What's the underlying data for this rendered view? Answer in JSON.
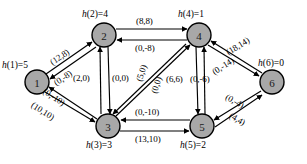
{
  "diagram": {
    "node_fill": "#a8a8a8",
    "stroke": "#000000",
    "nodes": [
      {
        "id": "1",
        "label": "1",
        "h_name": "h",
        "h_arg": "(1)",
        "h_eq": "=",
        "h_value": "5",
        "h_text": "h(1)=5",
        "cx": 37,
        "cy": 82
      },
      {
        "id": "2",
        "label": "2",
        "h_name": "h",
        "h_arg": "(2)",
        "h_eq": "=",
        "h_value": "4",
        "h_text": "h(2)=4",
        "cx": 104,
        "cy": 35
      },
      {
        "id": "3",
        "label": "3",
        "h_name": "h",
        "h_arg": "(3)",
        "h_eq": "=",
        "h_value": "3",
        "h_text": "h(3)=3",
        "cx": 108,
        "cy": 126
      },
      {
        "id": "4",
        "label": "4",
        "h_name": "h",
        "h_arg": "(4)",
        "h_eq": "=",
        "h_value": "1",
        "h_text": "h(4)=1",
        "cx": 199,
        "cy": 35
      },
      {
        "id": "5",
        "label": "5",
        "h_name": "h",
        "h_arg": "(5)",
        "h_eq": "=",
        "h_value": "2",
        "h_text": "h(5)=2",
        "cx": 202,
        "cy": 126
      },
      {
        "id": "6",
        "label": "6",
        "h_name": "h",
        "h_arg": "(6)",
        "h_eq": "=",
        "h_value": "0",
        "h_text": "h(6)=0",
        "cx": 272,
        "cy": 82
      }
    ],
    "edge_labels": [
      {
        "id": "e12",
        "text": "(12,8)",
        "from": "1",
        "to": "2",
        "cap": 12,
        "flow": 8
      },
      {
        "id": "e21",
        "text": "(0,-8)",
        "from": "2",
        "to": "1",
        "cap": 0,
        "flow": -8
      },
      {
        "id": "e23",
        "text": "(2,0)",
        "from": "2",
        "to": "3",
        "cap": 2,
        "flow": 0
      },
      {
        "id": "e31",
        "text": "(0,-10)",
        "from": "3",
        "to": "1",
        "cap": 0,
        "flow": -10
      },
      {
        "id": "e13",
        "text": "(10,10)",
        "from": "1",
        "to": "3",
        "cap": 10,
        "flow": 10
      },
      {
        "id": "e24",
        "text": "(8,8)",
        "from": "2",
        "to": "4",
        "cap": 8,
        "flow": 8
      },
      {
        "id": "e42",
        "text": "(0,-8)",
        "from": "4",
        "to": "2",
        "cap": 0,
        "flow": -8
      },
      {
        "id": "e32",
        "text": "(0,0)",
        "from": "3",
        "to": "2",
        "cap": 0,
        "flow": 0
      },
      {
        "id": "e34a",
        "text": "(5,0)",
        "from": "3",
        "to": "4",
        "cap": 5,
        "flow": 0
      },
      {
        "id": "e43a",
        "text": "(0,0)",
        "from": "4",
        "to": "3",
        "cap": 0,
        "flow": 0
      },
      {
        "id": "e45",
        "text": "(6,6)",
        "from": "4",
        "to": "5",
        "cap": 6,
        "flow": 6
      },
      {
        "id": "e54",
        "text": "(0,-6)",
        "from": "5",
        "to": "4",
        "cap": 0,
        "flow": -6
      },
      {
        "id": "e64",
        "text": "(18,14)",
        "from": "6",
        "to": "4",
        "cap": 18,
        "flow": 14
      },
      {
        "id": "e46",
        "text": "(0,-14)",
        "from": "4",
        "to": "6",
        "cap": 0,
        "flow": -14
      },
      {
        "id": "e65",
        "text": "(0,-4)",
        "from": "6",
        "to": "5",
        "cap": 0,
        "flow": -4
      },
      {
        "id": "e56",
        "text": "(4,4)",
        "from": "5",
        "to": "6",
        "cap": 4,
        "flow": 4
      },
      {
        "id": "e53",
        "text": "(0,-10)",
        "from": "5",
        "to": "3",
        "cap": 0,
        "flow": -10
      },
      {
        "id": "e35",
        "text": "(13,10)",
        "from": "3",
        "to": "5",
        "cap": 13,
        "flow": 10
      }
    ]
  }
}
